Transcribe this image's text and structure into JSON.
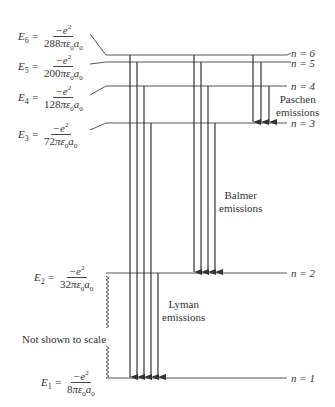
{
  "diagram": {
    "levels": [
      {
        "n": 6,
        "label": "n = 6",
        "energy_lhs": "E",
        "energy_sub": "6",
        "numerator": "−e",
        "denominator_coef": "288",
        "y": 55
      },
      {
        "n": 5,
        "label": "n = 5",
        "energy_lhs": "E",
        "energy_sub": "5",
        "numerator": "−e",
        "denominator_coef": "200",
        "y": 62
      },
      {
        "n": 4,
        "label": "n = 4",
        "energy_lhs": "E",
        "energy_sub": "4",
        "numerator": "−e",
        "denominator_coef": "128",
        "y": 86
      },
      {
        "n": 3,
        "label": "n = 3",
        "energy_lhs": "E",
        "energy_sub": "3",
        "numerator": "−e",
        "denominator_coef": "72",
        "y": 123
      },
      {
        "n": 2,
        "label": "n = 2",
        "energy_lhs": "E",
        "energy_sub": "2",
        "numerator": "−e",
        "denominator_coef": "32",
        "y": 273
      },
      {
        "n": 1,
        "label": "n = 1",
        "energy_lhs": "E",
        "energy_sub": "1",
        "numerator": "−e",
        "denominator_coef": "8",
        "y": 378
      }
    ],
    "denominator_suffix": "πε₀a₀",
    "series": [
      {
        "name": "Lyman",
        "line1": "Lyman",
        "line2": "emissions",
        "to_n": 1,
        "from_n": [
          2,
          3,
          4,
          5,
          6
        ]
      },
      {
        "name": "Balmer",
        "line1": "Balmer",
        "line2": "emissions",
        "to_n": 2,
        "from_n": [
          3,
          4,
          5,
          6
        ]
      },
      {
        "name": "Paschen",
        "line1": "Paschen",
        "line2": "emissions",
        "to_n": 3,
        "from_n": [
          4,
          5,
          6
        ]
      }
    ],
    "note": "Not shown to scale",
    "colors": {
      "line": "#444444",
      "text": "#333333",
      "background": "#ffffff"
    }
  }
}
